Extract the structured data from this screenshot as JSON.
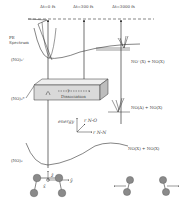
{
  "diagram": {
    "time_delays": [
      "Δt=0 fs",
      "Δt=300 fs",
      "Δt=3000 fs"
    ],
    "pe_spectrum_label": [
      "PE",
      "Spectrum"
    ],
    "states": {
      "cation": "(NO)₂⁺",
      "excited": "(NO)₂*",
      "ground": "(NO)₂"
    },
    "asymptotes": {
      "ion_limit": "NO⁺(X) + NO(X)",
      "excited_limit": "NO(A) + NO(X)",
      "ground_limit": "NO(X) + NO(X)"
    },
    "box": {
      "label": "Dissociation",
      "question_mark": "?"
    },
    "axes_inset": {
      "energy_label": "energy",
      "coord1": "r N-O",
      "coord2": "r N-N"
    },
    "molecule_axes": {
      "z": "ẑ",
      "y": "ŷ",
      "x": "x̂"
    },
    "atoms": {
      "nitrogen": "N",
      "oxygen": "O"
    },
    "colors": {
      "line": "#333333",
      "box_front": "#d9d9d9",
      "box_top": "#eeeeee",
      "box_side": "#bdbdbd",
      "atom_fill": "#8a8a8a",
      "text": "#444444"
    }
  }
}
